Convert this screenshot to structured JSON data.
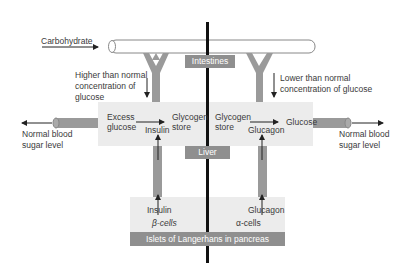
{
  "diagram": {
    "input_label": "Carbohydrate",
    "organs": {
      "intestines": "Intestines",
      "liver": "Liver",
      "pancreas": "Islets of Langerhans in pancreas"
    },
    "left": {
      "condition": [
        "Higher than normal",
        "concentration of",
        "glucose"
      ],
      "liver_from": [
        "Excess",
        "glucose"
      ],
      "liver_to": [
        "Glycogen",
        "store"
      ],
      "hormone_liver": "Insulin",
      "hormone_pancreas": "Insulin",
      "cells": "β-cells",
      "outcome": [
        "Normal blood",
        "sugar level"
      ]
    },
    "right": {
      "condition": [
        "Lower than normal",
        "concentration of glucose"
      ],
      "liver_from": [
        "Glycogen",
        "store"
      ],
      "liver_to": "Glucose",
      "hormone_liver": "Glucagon",
      "hormone_pancreas": "Glucagon",
      "cells": "α-cells",
      "outcome": [
        "Normal blood",
        "sugar level"
      ]
    },
    "colors": {
      "panel": "#ececec",
      "label_box": "#8f8f8f",
      "divider": "#111111",
      "vessel": "#9a9a9a"
    }
  }
}
